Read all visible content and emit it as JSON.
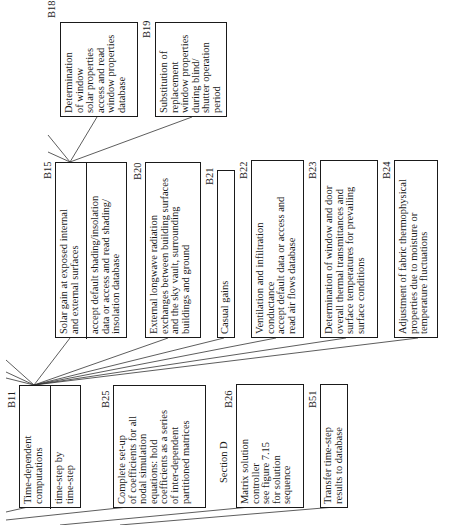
{
  "diagram": {
    "orientation": "rotated 90deg counter-clockwise",
    "boxes": {
      "B18": {
        "id": "B18",
        "text": "Determination\nof window\nsolar properties\naccess and read\nwindow properties\ndatabase"
      },
      "B19": {
        "id": "B19",
        "text": "Substitution of\nreplacement\nwindow properties\nduring blind/\nshutter operation\nperiod"
      },
      "B15": {
        "id": "B15",
        "text": "Solar gain at exposed internal\nand external surfaces",
        "sub": "accept default shading/insolation\ndata or access and read shading/\ninsolation database"
      },
      "B20": {
        "id": "B20",
        "text": "External longwave radiation\nexchanges between building surfaces\nand the sky vault, surrounding\nbuildings and ground"
      },
      "B21": {
        "id": "B21",
        "text": "Casual gains"
      },
      "B22": {
        "id": "B22",
        "text": "Ventilation and infiltration\nconductance\naccept default data or access and\nread air flows database"
      },
      "B23": {
        "id": "B23",
        "text": "Determination of window and door\noverall thermal transmittances and\nsurface temperatures for prevailing\nsurface conditions"
      },
      "B24": {
        "id": "B24",
        "text": "Adjustment of fabric thermophysical\nproperties due to moisture or\ntemperature fluctuations"
      },
      "B11": {
        "id": "B11",
        "text": "Time-dependent\ncomputations",
        "sub": "time-step by\ntime-step"
      },
      "B25": {
        "id": "B25",
        "text": "Complete set-up\nof coefficients for all\nnodal simulation\nequations: hold\ncoefficients as a series\nof inter-dependent\npartitioned matrices"
      },
      "B26": {
        "id": "B26",
        "text": "Matrix solution\ncontroller\nsee figure 7.15\nfor solution\nsequence"
      },
      "B51": {
        "id": "B51",
        "text": "Transfer time-step\nresults to database"
      }
    },
    "annotations": {
      "section_d": "Section D"
    },
    "connections": [
      [
        "B15",
        "B18"
      ],
      [
        "B15",
        "B19"
      ],
      [
        "B11",
        "B15"
      ],
      [
        "B11",
        "B20"
      ],
      [
        "B11",
        "B21"
      ],
      [
        "B11",
        "B22"
      ],
      [
        "B11",
        "B23"
      ],
      [
        "B11",
        "B24"
      ]
    ]
  }
}
